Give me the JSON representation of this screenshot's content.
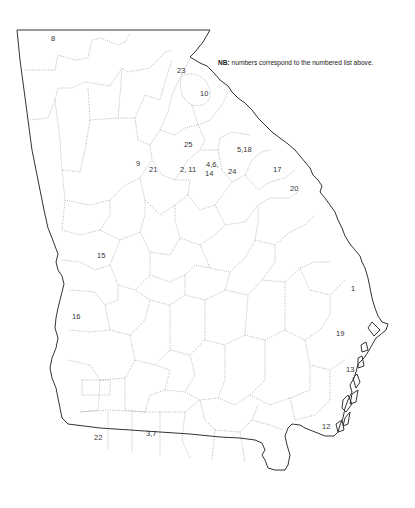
{
  "map": {
    "region": "Georgia (U.S. state) county outline map",
    "note": {
      "bold": "NB:",
      "text": " numbers correspond to the numbered list above."
    },
    "colors": {
      "background": "#ffffff",
      "state_border": "#333333",
      "county_border": "#9a9a9a",
      "label": "#333333"
    },
    "labels": [
      {
        "id": "8",
        "text": "8",
        "x": 51,
        "y": 35
      },
      {
        "id": "23",
        "text": "23",
        "x": 177,
        "y": 67
      },
      {
        "id": "10",
        "text": "10",
        "x": 200,
        "y": 90
      },
      {
        "id": "25",
        "text": "25",
        "x": 184,
        "y": 141
      },
      {
        "id": "5-18",
        "text": "5,18",
        "x": 237,
        "y": 146
      },
      {
        "id": "9",
        "text": "9",
        "x": 136,
        "y": 160
      },
      {
        "id": "21",
        "text": "21",
        "x": 149,
        "y": 166
      },
      {
        "id": "2-11",
        "text": "2, 11",
        "x": 180,
        "y": 166
      },
      {
        "id": "4-6-14-a",
        "text": "4,6,",
        "x": 206,
        "y": 161
      },
      {
        "id": "4-6-14-b",
        "text": "14",
        "x": 205,
        "y": 170
      },
      {
        "id": "24",
        "text": "24",
        "x": 228,
        "y": 168
      },
      {
        "id": "17",
        "text": "17",
        "x": 273,
        "y": 166
      },
      {
        "id": "20",
        "text": "20",
        "x": 290,
        "y": 185
      },
      {
        "id": "15",
        "text": "15",
        "x": 97,
        "y": 252
      },
      {
        "id": "1",
        "text": "1",
        "x": 351,
        "y": 285
      },
      {
        "id": "16",
        "text": "16",
        "x": 72,
        "y": 313
      },
      {
        "id": "19",
        "text": "19",
        "x": 336,
        "y": 330
      },
      {
        "id": "13",
        "text": "13",
        "x": 346,
        "y": 366
      },
      {
        "id": "12",
        "text": "12",
        "x": 322,
        "y": 423
      },
      {
        "id": "22",
        "text": "22",
        "x": 94,
        "y": 434
      },
      {
        "id": "3-7",
        "text": "3,7",
        "x": 146,
        "y": 430
      }
    ]
  }
}
